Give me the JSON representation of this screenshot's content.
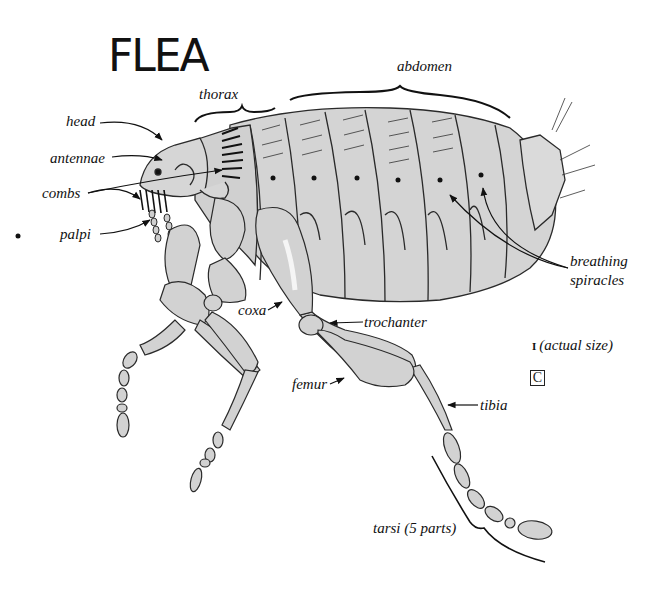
{
  "title": "FLEA",
  "labels": {
    "thorax": "thorax",
    "abdomen": "abdomen",
    "head": "head",
    "antennae": "antennae",
    "combs": "combs",
    "palpi": "palpi",
    "breathing_line1": "breathing",
    "breathing_line2": "spiracles",
    "coxa": "coxa",
    "trochanter": "trochanter",
    "femur": "femur",
    "tibia": "tibia",
    "tarsi": "tarsi (5 parts)",
    "actual_size": "(actual size)",
    "scale_glyph": "I"
  },
  "corner_mark": "C",
  "colors": {
    "body_fill": "#d4d4d4",
    "body_light": "#e6e6e6",
    "outline": "#2a2a2a",
    "text": "#111111"
  }
}
